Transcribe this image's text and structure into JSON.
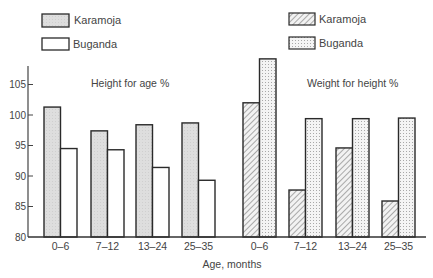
{
  "chart_data": {
    "type": "bar",
    "xlabel": "Age, months",
    "ylabel": "",
    "ylim": [
      80,
      110
    ],
    "yticks": [
      80,
      85,
      90,
      95,
      100,
      105
    ],
    "grid": false,
    "legend_position": "top, one legend per panel",
    "panels": [
      {
        "title": "Height for age %",
        "categories": [
          "0–6",
          "7–12",
          "13–24",
          "25–35"
        ],
        "series": [
          {
            "name": "Karamoja",
            "fill": "light grey shaded",
            "values": [
              101.3,
              97.4,
              98.4,
              98.7
            ]
          },
          {
            "name": "Buganda",
            "fill": "white",
            "values": [
              94.5,
              94.3,
              91.4,
              89.3
            ]
          }
        ]
      },
      {
        "title": "Weight for height %",
        "categories": [
          "0–6",
          "7–12",
          "13–24",
          "25–35"
        ],
        "series": [
          {
            "name": "Karamoja",
            "fill": "diagonal hatch",
            "values": [
              102.0,
              87.7,
              94.6,
              85.9
            ]
          },
          {
            "name": "Buganda",
            "fill": "dotted stipple",
            "values": [
              109.2,
              99.4,
              99.4,
              99.5
            ]
          }
        ]
      }
    ]
  },
  "colors": {
    "outline": "#2a2a2a",
    "shade": "#dcdcdc",
    "axis": "#444444",
    "text": "#444444"
  }
}
